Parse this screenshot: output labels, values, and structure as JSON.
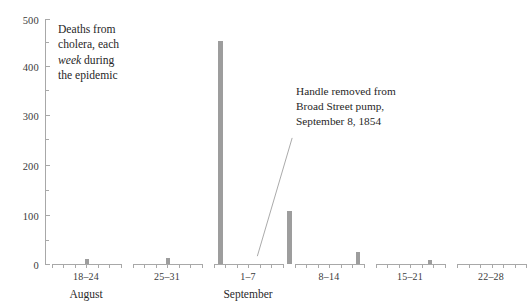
{
  "chart_data": {
    "type": "bar",
    "title": "Deaths from cholera, each week during the epidemic",
    "xlabel": "",
    "ylabel": "",
    "ylim": [
      0,
      500
    ],
    "grid": false,
    "legend": "none",
    "categories": [
      "18–24",
      "25–31",
      "1–7",
      "8–14",
      "15–21",
      "22–28"
    ],
    "months": [
      "August",
      "September"
    ],
    "values": [
      10,
      12,
      470,
      110,
      24,
      8
    ],
    "y_ticks_major": [
      0,
      100,
      200,
      300,
      400,
      500
    ],
    "y_ticks_minor": [
      50,
      150,
      250,
      350,
      450
    ],
    "y_tick_labels": [
      "0",
      "100",
      "200",
      "300",
      "400",
      "500"
    ],
    "annotations": [
      {
        "name": "pump-handle-removed",
        "text": "Handle removed from Broad Street pump, September 8, 1854",
        "points_to_category": "8–14"
      }
    ],
    "bar_color": "#9d9d9d",
    "axis_color": "#a8a8a8",
    "text_color": "#272727",
    "background": "#ffffff"
  },
  "title_note": {
    "line1": "Deaths from",
    "line2": "cholera, each",
    "line3_italic": "week",
    "line3_rest": " during",
    "line4": "the epidemic"
  },
  "callout_note": {
    "line1": "Handle removed from",
    "line2": "Broad Street pump,",
    "line3": "September 8, 1854"
  },
  "y_axis": {
    "labels": [
      "500",
      "400",
      "300",
      "200",
      "100",
      "0"
    ]
  },
  "x_axis": {
    "weeks": [
      {
        "label": "18–24",
        "month": "August"
      },
      {
        "label": "25–31",
        "month": ""
      },
      {
        "label": "1–7",
        "month": "September"
      },
      {
        "label": "8–14",
        "month": ""
      },
      {
        "label": "15–21",
        "month": ""
      },
      {
        "label": "22–28",
        "month": ""
      }
    ],
    "month_labels": [
      "August",
      "September"
    ]
  }
}
